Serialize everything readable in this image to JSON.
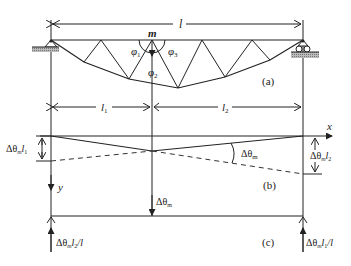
{
  "figure": {
    "panel_a": {
      "label": "(a)",
      "span_label": "l",
      "node_label": "m",
      "angles": [
        "φ1",
        "φ2",
        "φ3"
      ],
      "phi1_base": "φ",
      "phi1_sub": "1",
      "phi2_base": "φ",
      "phi2_sub": "2",
      "phi3_base": "φ",
      "phi3_sub": "3"
    },
    "panel_b": {
      "label": "(b)",
      "l1_base": "l",
      "l1_sub": "1",
      "l2_base": "l",
      "l2_sub": "2",
      "x_axis": "x",
      "y_axis": "y",
      "left_disp": "Δθ",
      "left_disp_sub": "m",
      "left_disp_tail": "l",
      "left_disp_tail_sub": "1",
      "right_disp": "Δθ",
      "right_disp_sub": "m",
      "right_disp_tail": "l",
      "right_disp_tail_sub": "2",
      "angle_label": "Δθ",
      "angle_label_sub": "m"
    },
    "panel_c": {
      "label": "(c)",
      "load_label": "Δθ",
      "load_label_sub": "m",
      "left_reaction": "Δθ",
      "left_reaction_sub": "m",
      "left_reaction_tail": "l",
      "left_reaction_tail_sub": "2",
      "left_reaction_end": "/l",
      "right_reaction": "Δθ",
      "right_reaction_sub": "m",
      "right_reaction_tail": "l",
      "right_reaction_tail_sub": "1",
      "right_reaction_end": "/l"
    }
  }
}
